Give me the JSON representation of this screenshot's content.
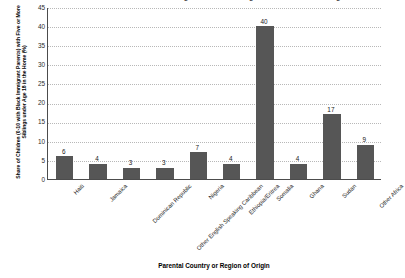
{
  "chart_data": {
    "type": "bar",
    "title": "Share of Children with Black Immigrant Parents Living with Five or More Siblings",
    "xlabel": "Parental Country or Region of Origin",
    "ylabel": "Share of Children (0-10 with Black Immigrant Parents) with Five or More Siblings under Age 18 in the Home (%)",
    "categories": [
      "Haiti",
      "Jamaica",
      "Dominican Republic",
      "Other English Speaking Caribbean",
      "Nigeria",
      "Ethiopia/Eritrea",
      "Somalia",
      "Ghana",
      "Sudan",
      "Other Africa"
    ],
    "values": [
      6,
      4,
      3,
      3,
      7,
      4,
      40,
      4,
      17,
      9
    ],
    "value_labels": [
      "6",
      "4",
      "3",
      "3",
      "7",
      "4",
      "40",
      "4",
      "17",
      "9"
    ],
    "ylim": [
      0,
      45
    ],
    "yticks": [
      0,
      5,
      10,
      15,
      20,
      25,
      30,
      35,
      40,
      45
    ],
    "ytick_labels": [
      "0",
      "5",
      "10",
      "15",
      "20",
      "25",
      "30",
      "35",
      "40",
      "45"
    ],
    "grid": true,
    "legend": null,
    "bar_color": "#565656",
    "axis_color": "#4c4c4c",
    "gridline_color": "#b8b8b8"
  }
}
